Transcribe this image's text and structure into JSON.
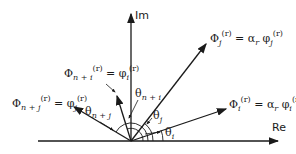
{
  "axes": {
    "real_label": "Re",
    "imag_label": "Im"
  },
  "vectors": [
    {
      "id": "Phi_j",
      "label_lhs": "Φ",
      "sub_lhs": "j",
      "sup": "(r)",
      "rhs": "α",
      "rhs_sub": "r",
      "rhs_phi": "φ",
      "rhs_phi_sub": "j"
    },
    {
      "id": "Phi_i",
      "label_lhs": "Φ",
      "sub_lhs": "i",
      "sup": "(r)",
      "rhs": "α",
      "rhs_sub": "r",
      "rhs_phi": "φ",
      "rhs_phi_sub": "i"
    },
    {
      "id": "Phi_n_plus_i",
      "label_lhs": "Φ",
      "sub_lhs": "n + i",
      "sup": "(r)",
      "rhs_phi": "φ",
      "rhs_phi_sub": "i"
    },
    {
      "id": "Phi_n_plus_j",
      "label_lhs": "Φ",
      "sub_lhs": "n + j",
      "sup": "(r)",
      "rhs_phi": "φ",
      "rhs_phi_sub": "j"
    }
  ],
  "angles": {
    "theta_i": "θi",
    "theta_j": "θj",
    "theta_n_plus_i": "θn + i",
    "theta_n_plus_j": "θn + j"
  },
  "symbols": {
    "eq": "=",
    "theta": "θ",
    "i": "i",
    "j": "j",
    "n_i": "n + i",
    "n_j": "n + j"
  }
}
